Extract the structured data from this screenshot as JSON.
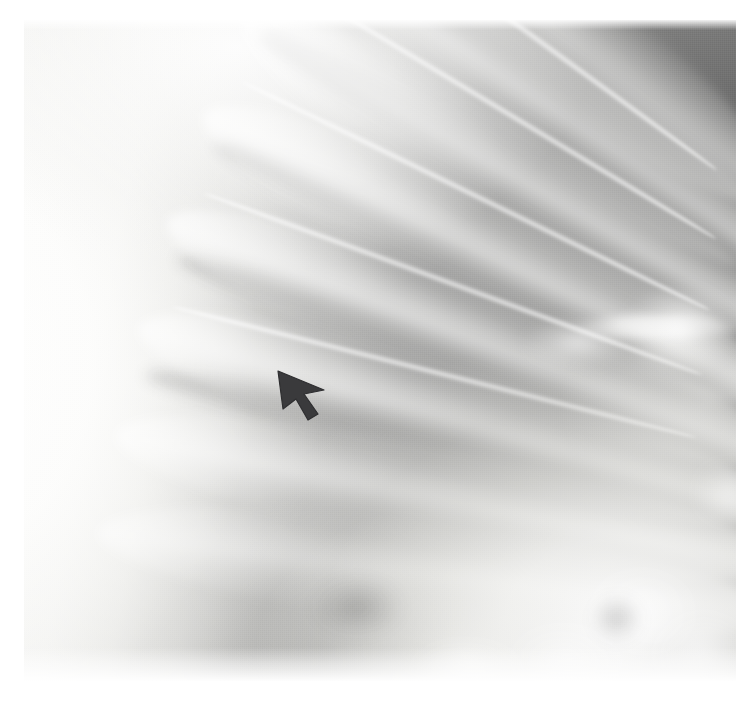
{
  "image": {
    "modality": "radiograph",
    "region_depicted": "chest",
    "view": "lateral lung field close-up",
    "width_px": 740,
    "height_px": 709,
    "film_left_px": 24,
    "film_top_px": 20,
    "film_width_px": 712,
    "film_height_px": 661,
    "border_color": "#ffffff",
    "background_color": "#ffffff"
  },
  "tones": {
    "film_border": "#ffffff",
    "soft_tissue_bright": "#fbfbfa",
    "chest_wall_band": "#eeeeec",
    "mid_gray": "#9d9d9b",
    "lung_field_dark": "#72706f",
    "darkest_lung": "#6a6a6a",
    "marker_dark": "#3a3a3c"
  },
  "annotation": {
    "marker_type": "arrow-marker",
    "label": "arrow marker",
    "direction": "up-left",
    "tip_x": 278,
    "tip_y": 371,
    "tail_x": 322,
    "tail_y": 414,
    "color": "#3a3a3c",
    "points_to": "lateral pleural / chest-wall interface"
  },
  "anatomy": {
    "ribs": [
      {
        "name": "rib-band-1",
        "left": 250,
        "top": -52,
        "width": 560,
        "height": 120,
        "rotate": 37,
        "opacity": 0.7
      },
      {
        "name": "rib-band-2",
        "left": 214,
        "top": 18,
        "width": 600,
        "height": 118,
        "rotate": 34,
        "opacity": 0.82
      },
      {
        "name": "rib-band-3",
        "left": 178,
        "top": 96,
        "width": 620,
        "height": 116,
        "rotate": 30,
        "opacity": 0.88
      },
      {
        "name": "rib-band-4",
        "left": 148,
        "top": 178,
        "width": 640,
        "height": 114,
        "rotate": 26,
        "opacity": 0.9
      },
      {
        "name": "rib-band-5",
        "left": 122,
        "top": 262,
        "width": 650,
        "height": 112,
        "rotate": 21,
        "opacity": 0.88
      },
      {
        "name": "rib-band-6",
        "left": 102,
        "top": 344,
        "width": 660,
        "height": 110,
        "rotate": 16,
        "opacity": 0.82
      },
      {
        "name": "rib-band-7",
        "left": 86,
        "top": 424,
        "width": 665,
        "height": 108,
        "rotate": 11,
        "opacity": 0.74
      },
      {
        "name": "rib-band-8",
        "left": 72,
        "top": 500,
        "width": 670,
        "height": 106,
        "rotate": 7,
        "opacity": 0.62
      }
    ],
    "rib_cortical_lines": [
      {
        "name": "rib-edge-1",
        "left": 268,
        "top": 8,
        "width": 470,
        "height": 8,
        "rotate": 36
      },
      {
        "name": "rib-edge-2",
        "left": 228,
        "top": 86,
        "width": 500,
        "height": 8,
        "rotate": 31
      },
      {
        "name": "rib-edge-3",
        "left": 192,
        "top": 172,
        "width": 520,
        "height": 8,
        "rotate": 26
      },
      {
        "name": "rib-edge-4",
        "left": 164,
        "top": 260,
        "width": 530,
        "height": 8,
        "rotate": 20
      },
      {
        "name": "rib-edge-5",
        "left": 140,
        "top": 348,
        "width": 540,
        "height": 8,
        "rotate": 14
      }
    ],
    "intercostal_spaces": [
      {
        "name": "intercostal-1",
        "left": 238,
        "top": 44,
        "width": 560,
        "height": 46,
        "rotate": 35
      },
      {
        "name": "intercostal-2",
        "left": 200,
        "top": 130,
        "width": 580,
        "height": 46,
        "rotate": 29
      },
      {
        "name": "intercostal-3",
        "left": 168,
        "top": 218,
        "width": 600,
        "height": 46,
        "rotate": 23
      },
      {
        "name": "intercostal-4",
        "left": 140,
        "top": 306,
        "width": 620,
        "height": 46,
        "rotate": 17
      },
      {
        "name": "intercostal-5",
        "left": 116,
        "top": 392,
        "width": 630,
        "height": 46,
        "rotate": 11
      }
    ],
    "vascular_markings": [
      {
        "name": "hilar-vessel-upper-right",
        "left": 596,
        "top": 262,
        "width": 118,
        "height": 96
      },
      {
        "name": "hilar-vessel-branch",
        "left": 498,
        "top": 296,
        "width": 112,
        "height": 54
      },
      {
        "name": "horizontal-vessel-band",
        "left": 548,
        "top": 296,
        "width": 170,
        "height": 22
      }
    ],
    "basal_opacities": [
      {
        "name": "basal-opacity-a",
        "left": 556,
        "top": 546,
        "width": 120,
        "height": 92
      },
      {
        "name": "basal-opacity-b",
        "left": 624,
        "top": 588,
        "width": 104,
        "height": 86
      },
      {
        "name": "basal-opacity-c",
        "left": 482,
        "top": 600,
        "width": 122,
        "height": 76
      },
      {
        "name": "basal-opacity-d",
        "left": 386,
        "top": 618,
        "width": 118,
        "height": 64
      },
      {
        "name": "basal-opacity-e",
        "left": 668,
        "top": 438,
        "width": 76,
        "height": 70
      },
      {
        "name": "basal-lucency-a",
        "left": 566,
        "top": 574,
        "width": 54,
        "height": 50
      },
      {
        "name": "basal-lucency-b",
        "left": 286,
        "top": 556,
        "width": 96,
        "height": 62
      }
    ]
  }
}
